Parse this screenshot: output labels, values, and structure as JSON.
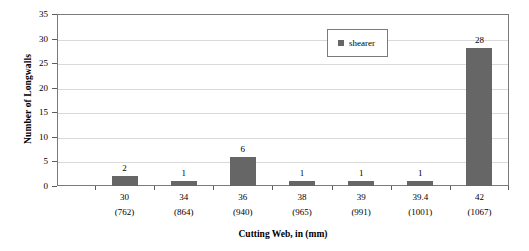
{
  "chart_data": {
    "type": "bar",
    "title": "",
    "subtitle": "",
    "xlabel": "Cutting Web, in (mm)",
    "ylabel": "Number of Longwalls",
    "categories": [
      "30",
      "34",
      "36",
      "38",
      "39",
      "39.4",
      "42"
    ],
    "category_sublabels": [
      "(762)",
      "(864)",
      "(940)",
      "(965)",
      "(991)",
      "(1001)",
      "(1067)"
    ],
    "series": [
      {
        "name": "shearer",
        "values": [
          2,
          1,
          6,
          1,
          1,
          1,
          28
        ],
        "color": "#666666"
      }
    ],
    "values": [
      2,
      1,
      6,
      1,
      1,
      1,
      28
    ],
    "data_labels": [
      "2",
      "1",
      "6",
      "1",
      "1",
      "1",
      "28"
    ],
    "ylim": [
      0,
      35
    ],
    "ytick_values": [
      0,
      5,
      10,
      15,
      20,
      25,
      30,
      35
    ],
    "ytick_labels": [
      "0",
      "5",
      "10",
      "15",
      "20",
      "25",
      "30",
      "35"
    ],
    "grid": true,
    "grid_axis": "y",
    "legend": {
      "visible": true,
      "position": "upper-center-right",
      "entries": [
        {
          "label": "shearer",
          "color": "#666666",
          "marker": "square"
        }
      ]
    },
    "axis_line_color": "#7b7b7b",
    "gridline_color": "#d9d9d9",
    "background_color": "#ffffff"
  }
}
